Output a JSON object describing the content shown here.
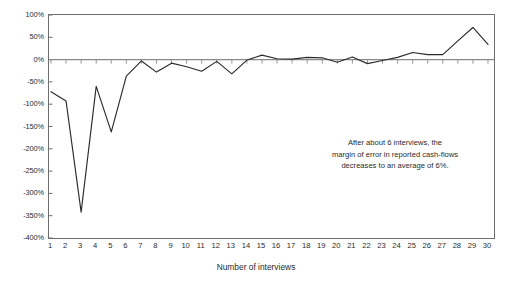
{
  "chart_data": {
    "type": "line",
    "title": "",
    "xlabel": "Number of interviews",
    "ylabel": "",
    "x": [
      1,
      2,
      3,
      4,
      5,
      6,
      7,
      8,
      9,
      10,
      11,
      12,
      13,
      14,
      15,
      16,
      17,
      18,
      19,
      20,
      21,
      22,
      23,
      24,
      25,
      26,
      27,
      28,
      29,
      30
    ],
    "values": [
      -72,
      -93,
      -342,
      -60,
      -162,
      -37,
      -3,
      -28,
      -8,
      -16,
      -26,
      -4,
      -32,
      -1,
      10,
      2,
      1,
      5,
      4,
      -6,
      6,
      -9,
      -2,
      5,
      16,
      11,
      11,
      42,
      72,
      34
    ],
    "categories": [
      "1",
      "2",
      "3",
      "4",
      "5",
      "6",
      "7",
      "8",
      "9",
      "10",
      "11",
      "12",
      "13",
      "14",
      "15",
      "16",
      "17",
      "18",
      "19",
      "20",
      "21",
      "22",
      "23",
      "24",
      "25",
      "26",
      "27",
      "28",
      "29",
      "30"
    ],
    "ytick_labels": [
      "100%",
      "50%",
      "0%",
      "-50%",
      "-100%",
      "-150%",
      "-200%",
      "-250%",
      "-300%",
      "-350%",
      "-400%"
    ],
    "ytick_values": [
      100,
      50,
      0,
      -50,
      -100,
      -150,
      -200,
      -250,
      -300,
      -350,
      -400
    ],
    "ylim": [
      -400,
      100
    ],
    "xlim": [
      1,
      30
    ],
    "grid": false,
    "legend": false,
    "series_name": "margin of error in reported cash-flows",
    "line_color": "#2b2b2b",
    "zero_line_color": "#8a8a8a",
    "frame_color": "#6e6e6e",
    "annotations": [
      {
        "lines": [
          "After about 6 interviews, the",
          "margin of error in reported cash-flows",
          "decreases to an average of 6%."
        ]
      }
    ]
  }
}
